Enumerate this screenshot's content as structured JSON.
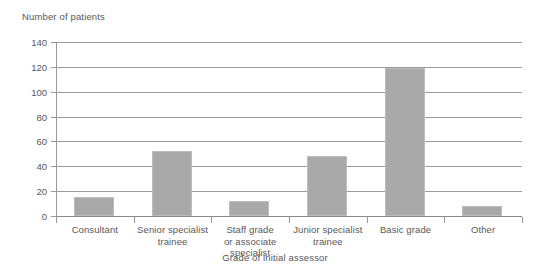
{
  "chart_data": {
    "type": "bar",
    "title": "",
    "xlabel": "Grade of initial assessor",
    "ylabel": "Number of patients",
    "categories": [
      "Consultant",
      "Senior specialist trainee",
      "Staff grade or associate specialist",
      "Junior specialist trainee",
      "Basic grade",
      "Other"
    ],
    "values": [
      15,
      52,
      12,
      48,
      119,
      8
    ],
    "ylim": [
      0,
      140
    ],
    "ytick_labels": [
      "0",
      "20",
      "40",
      "60",
      "80",
      "100",
      "120",
      "140"
    ],
    "ytick_values": [
      0,
      20,
      40,
      60,
      80,
      100,
      120,
      140
    ],
    "grid": "horizontal",
    "legend": "none",
    "bar_color": "#a9a9a9",
    "axis_color": "#9a9a9a",
    "text_color": "#58585a",
    "background": "#ffffff"
  },
  "category_label_lines": [
    [
      "Consultant"
    ],
    [
      "Senior specialist",
      "trainee"
    ],
    [
      "Staff grade",
      "or associate",
      "specialist"
    ],
    [
      "Junior specialist",
      "trainee"
    ],
    [
      "Basic grade"
    ],
    [
      "Other"
    ]
  ]
}
